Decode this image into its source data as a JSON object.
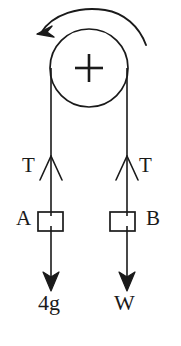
{
  "diagram": {
    "stroke_color": "#1a1a1a",
    "background_color": "#ffffff",
    "pulley": {
      "name": "pulley-wheel",
      "center_x": 89,
      "center_y": 68,
      "radius": 39,
      "axle_marker": "plus"
    },
    "rotation_arrow": {
      "name": "counterclockwise-rotation-arrow",
      "direction": "counterclockwise",
      "arrowhead_at": "left"
    },
    "left_side": {
      "string_x": 51,
      "tension_label": "T",
      "block_label": "A",
      "weight_label": "4g"
    },
    "right_side": {
      "string_x": 127,
      "tension_label": "T",
      "block_label": "B",
      "weight_label": "W"
    }
  }
}
